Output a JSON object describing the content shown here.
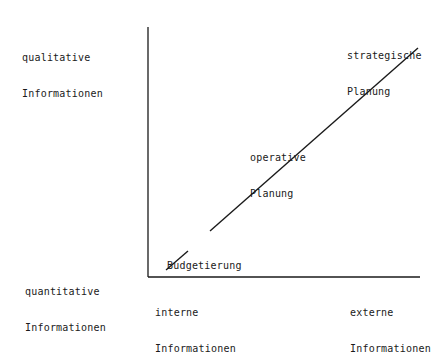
{
  "diagram": {
    "y_axis": {
      "top_label": [
        "qualitative",
        "Informationen"
      ],
      "bottom_label": [
        "quantitative",
        "Informationen"
      ]
    },
    "x_axis": {
      "left_label": [
        "interne",
        "Informationen"
      ],
      "right_label": [
        "externe",
        "Informationen"
      ]
    },
    "points": [
      {
        "label": "Budgetierung"
      },
      {
        "label": [
          "operative",
          "Planung"
        ]
      },
      {
        "label": [
          "strategische",
          "Planung"
        ]
      }
    ],
    "colors": {
      "line": "#1a1a1a",
      "background": "#ffffff"
    }
  }
}
